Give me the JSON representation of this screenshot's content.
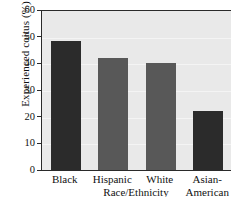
{
  "chart_data": {
    "type": "bar",
    "title": "",
    "xlabel": "Race/Ethnicity",
    "ylabel": "Experienced coitus (%)",
    "categories": [
      "Black",
      "Hispanic",
      "White",
      "Asian-American"
    ],
    "category_lines": [
      [
        "Black"
      ],
      [
        "Hispanic"
      ],
      [
        "White"
      ],
      [
        "Asian-",
        "American"
      ]
    ],
    "values": [
      48.5,
      42,
      40,
      22
    ],
    "ylim": [
      0,
      60
    ],
    "yticks": [
      0,
      10,
      20,
      30,
      40,
      50,
      60
    ],
    "ytick_labels": [
      "0",
      "10",
      "20",
      "30",
      "40",
      "50",
      "60"
    ],
    "grid": true,
    "legend": "none",
    "bar_colors": [
      "#2b2b2b",
      "#585858",
      "#585858",
      "#2b2b2b"
    ],
    "plot_background": "#e9e9e9",
    "axis_color": "#2a2a2a",
    "gridline_color": "#f4f4f4"
  }
}
